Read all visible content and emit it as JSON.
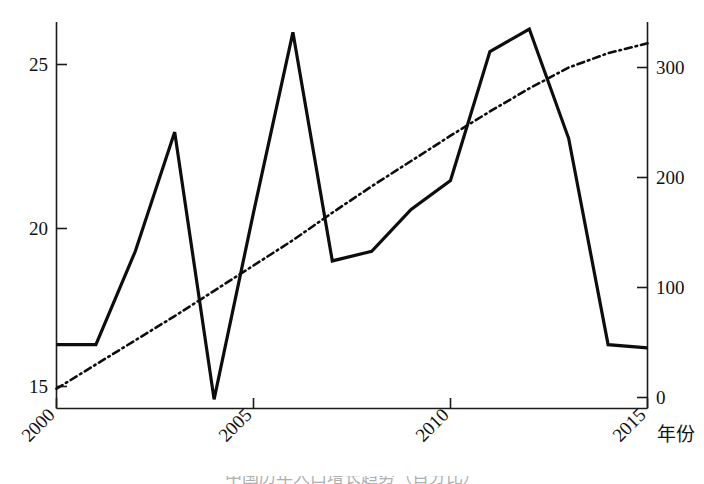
{
  "chart_data": {
    "type": "line",
    "title": "",
    "xlabel": "年份",
    "ylabel": "",
    "x": [
      2000,
      2001,
      2002,
      2003,
      2004,
      2005,
      2006,
      2007,
      2008,
      2009,
      2010,
      2011,
      2012,
      2013,
      2014,
      2015
    ],
    "xlim": [
      2000,
      2015
    ],
    "xticks": [
      2000,
      2005,
      2010,
      2015
    ],
    "xticklabels": [
      "2000",
      "2005",
      "2010",
      "2015"
    ],
    "xtick_rotation_deg": 45,
    "grid": false,
    "legend": "none",
    "left_axis": {
      "ylim": [
        14.2,
        26.6
      ],
      "yticks": [
        15,
        20,
        25
      ],
      "yticklabels": [
        "15",
        "20",
        "25"
      ]
    },
    "right_axis": {
      "ylim": [
        -11,
        332
      ],
      "yticks": [
        0,
        100,
        200,
        300
      ],
      "yticklabels": [
        "0",
        "100",
        "200",
        "300"
      ]
    },
    "series": [
      {
        "name": "solid-series",
        "style": "solid",
        "axis": "left",
        "color": "#0d0d0d",
        "values": [
          16.3,
          16.3,
          19.2,
          22.9,
          14.6,
          20.4,
          26.0,
          18.9,
          19.2,
          20.5,
          21.4,
          25.4,
          26.1,
          22.7,
          16.3,
          16.2
        ]
      },
      {
        "name": "dash-dot-series",
        "style": "dash-dot",
        "axis": "right",
        "color": "#0d0d0d",
        "values": [
          8,
          30,
          52,
          74,
          97,
          120,
          143,
          168,
          192,
          215,
          238,
          260,
          281,
          300,
          313,
          322
        ]
      }
    ]
  },
  "axis_labels": {
    "x_axis_title": "年份",
    "left_ticks": [
      "25",
      "20",
      "15"
    ],
    "right_ticks": [
      "300",
      "200",
      "100",
      "0"
    ],
    "x_ticks": [
      "2000",
      "2005",
      "2010",
      "2015"
    ]
  },
  "caption": {
    "text": "中国历年人口增长趋势（百分比）"
  }
}
